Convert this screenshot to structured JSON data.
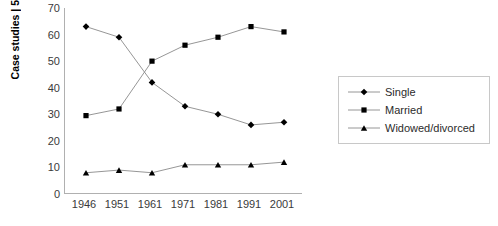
{
  "chart_data": {
    "type": "line",
    "title": "",
    "xlabel": "",
    "ylabel": "Case studies | 5",
    "categories": [
      "1946",
      "1951",
      "1961",
      "1971",
      "1981",
      "1991",
      "2001"
    ],
    "x": [
      1946,
      1951,
      1961,
      1971,
      1981,
      1991,
      2001
    ],
    "ylim": [
      0,
      70
    ],
    "yticks": [
      "0",
      "10",
      "20",
      "30",
      "40",
      "50",
      "60",
      "70"
    ],
    "ytick_values": [
      0,
      10,
      20,
      30,
      40,
      50,
      60,
      70
    ],
    "grid": false,
    "legend_position": "right",
    "series": [
      {
        "name": "Single",
        "marker": "diamond",
        "color": "#000000",
        "values": [
          63,
          59,
          42,
          33,
          30,
          26,
          27
        ]
      },
      {
        "name": "Married",
        "marker": "square",
        "color": "#000000",
        "values": [
          29.5,
          32,
          50,
          56,
          59,
          63,
          61
        ]
      },
      {
        "name": "Widowed/divorced",
        "marker": "triangle",
        "color": "#000000",
        "values": [
          8,
          9,
          8,
          11,
          11,
          11,
          12
        ]
      }
    ]
  },
  "legend": {
    "items": [
      {
        "label": "Single",
        "marker": "diamond"
      },
      {
        "label": "Married",
        "marker": "square"
      },
      {
        "label": "Widowed/divorced",
        "marker": "triangle"
      }
    ]
  },
  "axis": {
    "y_title": "Case studies | 5"
  }
}
